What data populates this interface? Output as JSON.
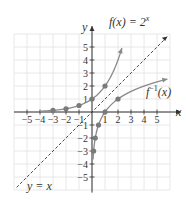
{
  "chart_data": {
    "type": "line",
    "title": "",
    "xlabel": "x",
    "ylabel": "y",
    "xlim": [
      -6,
      6
    ],
    "ylim": [
      -6,
      6
    ],
    "grid": true,
    "x_ticks": [
      -5,
      -4,
      -3,
      -2,
      -1,
      1,
      2,
      3,
      4,
      5
    ],
    "y_ticks": [
      -5,
      -4,
      -3,
      -2,
      -1,
      1,
      2,
      3,
      4,
      5
    ],
    "x_tick_labels": [
      "−5",
      "−4",
      "−3",
      "−2",
      "−1",
      "1",
      "2",
      "3",
      "4",
      "5"
    ],
    "y_tick_labels": [
      "−5",
      "−4",
      "−3",
      "−2",
      "−1",
      "1",
      "2",
      "3",
      "4",
      "5"
    ],
    "series": [
      {
        "name": "f(x) = 2^x",
        "label_text": "f(x) = 2",
        "label_exp": "x",
        "style": "solid",
        "color": "#8a8a8a",
        "points": [
          [
            -3,
            0.125
          ],
          [
            -2,
            0.25
          ],
          [
            -1,
            0.5
          ],
          [
            0,
            1
          ],
          [
            1,
            2
          ]
        ],
        "domain": [
          -4,
          2.3
        ]
      },
      {
        "name": "f^-1(x)",
        "label_text": "f",
        "label_exp": "−1",
        "label_tail": "(x)",
        "style": "solid",
        "color": "#8a8a8a",
        "points": [
          [
            0.125,
            -3
          ],
          [
            0.25,
            -2
          ],
          [
            0.5,
            -1
          ],
          [
            1,
            0
          ],
          [
            2,
            1
          ]
        ],
        "domain": [
          0.08,
          5.8
        ]
      },
      {
        "name": "y = x",
        "label_text": "y = x",
        "style": "dashed",
        "color": "#333333",
        "points": [
          [
            -5.8,
            -5.8
          ],
          [
            5.8,
            5.8
          ]
        ]
      }
    ]
  },
  "colors": {
    "axis": "#333333",
    "grid": "#e2e2e2",
    "curve": "#8a8a8a",
    "point": "#7a7a7a",
    "dashed": "#333333"
  }
}
